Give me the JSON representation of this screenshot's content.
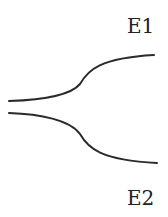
{
  "diagram": {
    "labels": {
      "upper": "E1",
      "lower": "E2"
    },
    "colors": {
      "line": "#2b2b2b",
      "text": "#222222",
      "background": "#ffffff"
    },
    "curves": [
      {
        "name": "upper-branch",
        "path": "M9,101 C40,100 70,96 80,84 C88,70 100,58 154,55"
      },
      {
        "name": "lower-branch",
        "path": "M9,113 C40,114 70,120 80,134 C88,148 100,160 157,163"
      }
    ]
  }
}
